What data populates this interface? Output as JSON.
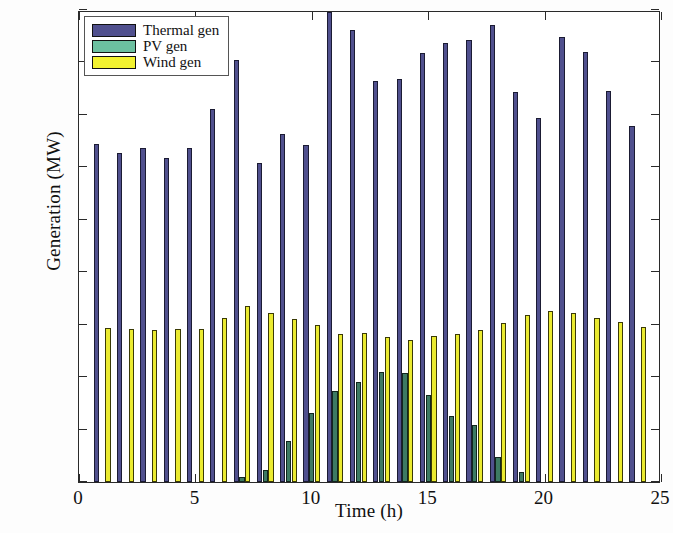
{
  "chart_data": {
    "type": "bar",
    "title": "",
    "xlabel": "Time (h)",
    "ylabel": "Generation (MW)",
    "xlim": [
      0,
      25
    ],
    "ylim": [
      0,
      900
    ],
    "xticks": [
      0,
      5,
      10,
      15,
      20,
      25
    ],
    "yticks": [
      0,
      100,
      200,
      300,
      400,
      500,
      600,
      700,
      800,
      900
    ],
    "grid": false,
    "legend_position": "top-left",
    "categories": [
      1,
      2,
      3,
      4,
      5,
      6,
      7,
      8,
      9,
      10,
      11,
      12,
      13,
      14,
      15,
      16,
      17,
      18,
      19,
      20,
      21,
      22,
      23,
      24
    ],
    "series": [
      {
        "name": "Thermal gen",
        "color": "#50508e",
        "values": [
          645,
          628,
          637,
          618,
          636,
          712,
          805,
          609,
          664,
          643,
          896,
          861,
          765,
          769,
          818,
          838,
          842,
          872,
          743,
          694,
          848,
          820,
          745,
          679
        ]
      },
      {
        "name": "PV gen",
        "color": "#6cc0a0",
        "values": [
          0,
          0,
          0,
          0,
          0,
          0,
          10,
          22,
          78,
          131,
          174,
          190,
          210,
          207,
          165,
          126,
          109,
          48,
          20,
          0,
          0,
          0,
          0,
          0
        ]
      },
      {
        "name": "Wind gen",
        "color": "#f2f230",
        "values": [
          294,
          292,
          290,
          292,
          291,
          313,
          335,
          322,
          311,
          299,
          282,
          285,
          276,
          271,
          279,
          282,
          290,
          303,
          318,
          327,
          322,
          313,
          305,
          296
        ]
      }
    ]
  },
  "legend": {
    "items": [
      {
        "label": "Thermal gen",
        "color": "#50508e"
      },
      {
        "label": "PV gen",
        "color": "#6cc0a0"
      },
      {
        "label": "Wind gen",
        "color": "#f2f230"
      }
    ]
  },
  "axes": {
    "y_title": "Generation (MW)",
    "x_title": "Time (h)",
    "y_tick_labels": [
      "0",
      "100",
      "200",
      "300",
      "400",
      "500",
      "600",
      "700",
      "800",
      "900"
    ],
    "x_tick_labels": [
      "0",
      "5",
      "10",
      "15",
      "20",
      "25"
    ]
  }
}
